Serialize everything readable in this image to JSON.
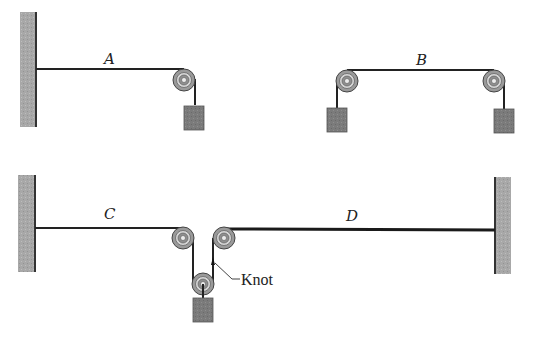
{
  "figure": {
    "type": "physics-diagram",
    "colors": {
      "wall": "#a9a9a9",
      "block": "#7d7d7d",
      "pulley": "#9a9a9a",
      "rope": "#222222",
      "background": "#ffffff"
    }
  },
  "panels": {
    "A": {
      "label": "A",
      "elements": [
        "left-wall",
        "string-A",
        "pulley",
        "hanging-block"
      ]
    },
    "B": {
      "label": "B",
      "elements": [
        "left-pulley",
        "left-hanging-block",
        "string-B",
        "right-pulley",
        "right-hanging-block"
      ]
    },
    "C": {
      "label": "C",
      "elements": [
        "left-wall",
        "string-C",
        "pulley",
        "movable-pulley",
        "hanging-block"
      ]
    },
    "D": {
      "label": "D",
      "elements": [
        "pulley",
        "string-D",
        "right-wall"
      ]
    }
  },
  "annotations": {
    "knot": "Knot"
  }
}
